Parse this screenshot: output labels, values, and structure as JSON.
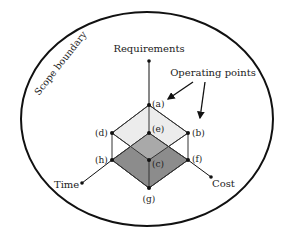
{
  "boundary": {
    "label": "Scope boundary"
  },
  "axes": {
    "requirements": "Requirements",
    "time": "Time",
    "cost": "Cost"
  },
  "annotation": "Operating points",
  "points": {
    "a": "(a)",
    "b": "(b)",
    "c": "(c)",
    "d": "(d)",
    "e": "(e)",
    "f": "(f)",
    "g": "(g)",
    "h": "(h)"
  },
  "colors": {
    "outline": "#111111",
    "light_fill": "#ececec",
    "mid_fill": "#a9a9a9",
    "dark_fill": "#8c8c8c"
  }
}
